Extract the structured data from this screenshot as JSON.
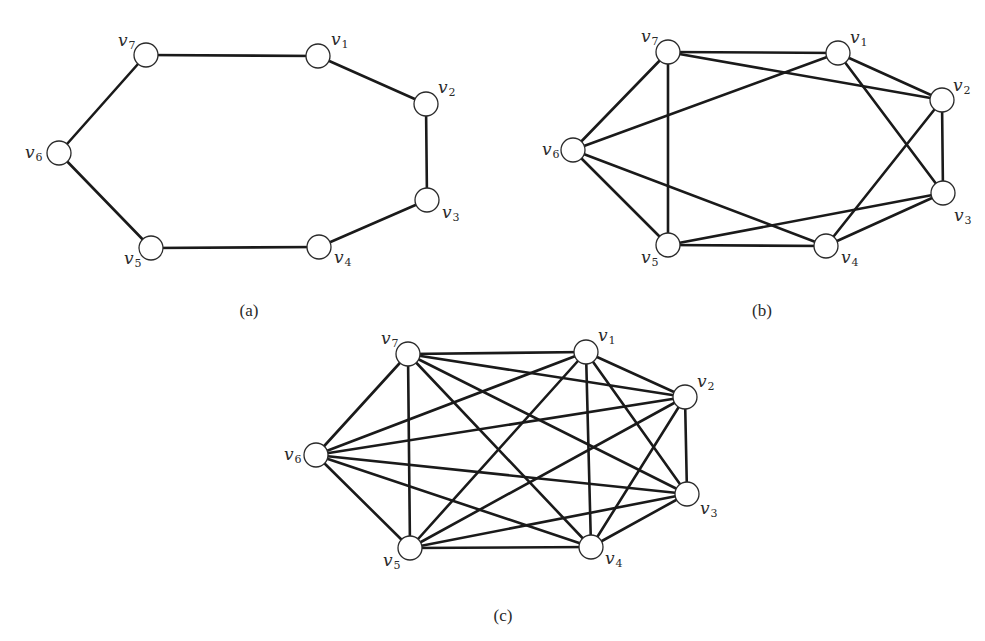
{
  "figure": {
    "panels": [
      {
        "id": "a",
        "caption": "(a)",
        "caption_pos": [
          249,
          316
        ],
        "description": "7-cycle C7",
        "vertices": [
          {
            "name": "v1",
            "base": "v",
            "sub": "1",
            "pos": [
              318,
              56
            ],
            "label_pos": [
              331,
              45
            ]
          },
          {
            "name": "v2",
            "base": "v",
            "sub": "2",
            "pos": [
              426,
              104
            ],
            "label_pos": [
              438,
              93
            ]
          },
          {
            "name": "v3",
            "base": "v",
            "sub": "3",
            "pos": [
              427,
              200
            ],
            "label_pos": [
              442,
              218
            ]
          },
          {
            "name": "v4",
            "base": "v",
            "sub": "4",
            "pos": [
              319,
              247
            ],
            "label_pos": [
              334,
              263
            ]
          },
          {
            "name": "v5",
            "base": "v",
            "sub": "5",
            "pos": [
              151,
              248
            ],
            "label_pos": [
              124,
              264
            ]
          },
          {
            "name": "v6",
            "base": "v",
            "sub": "6",
            "pos": [
              59,
              153
            ],
            "label_pos": [
              25,
              158
            ]
          },
          {
            "name": "v7",
            "base": "v",
            "sub": "7",
            "pos": [
              146,
              55
            ],
            "label_pos": [
              118,
              46
            ]
          }
        ],
        "edges": [
          [
            "v7",
            "v1"
          ],
          [
            "v1",
            "v2"
          ],
          [
            "v2",
            "v3"
          ],
          [
            "v3",
            "v4"
          ],
          [
            "v4",
            "v5"
          ],
          [
            "v5",
            "v6"
          ],
          [
            "v6",
            "v7"
          ]
        ]
      },
      {
        "id": "b",
        "caption": "(b)",
        "caption_pos": [
          762,
          316
        ],
        "description": "4-regular graph on 7 vertices (C7 plus distance-2 chords)",
        "vertices": [
          {
            "name": "v1",
            "base": "v",
            "sub": "1",
            "pos": [
              838,
              53
            ],
            "label_pos": [
              850,
              43
            ]
          },
          {
            "name": "v2",
            "base": "v",
            "sub": "2",
            "pos": [
              942,
              100
            ],
            "label_pos": [
              953,
              91
            ]
          },
          {
            "name": "v3",
            "base": "v",
            "sub": "3",
            "pos": [
              943,
              193
            ],
            "label_pos": [
              954,
              221
            ]
          },
          {
            "name": "v4",
            "base": "v",
            "sub": "4",
            "pos": [
              826,
              246
            ],
            "label_pos": [
              841,
              263
            ]
          },
          {
            "name": "v5",
            "base": "v",
            "sub": "5",
            "pos": [
              668,
              245
            ],
            "label_pos": [
              641,
              263
            ]
          },
          {
            "name": "v6",
            "base": "v",
            "sub": "6",
            "pos": [
              573,
              150
            ],
            "label_pos": [
              542,
              155
            ]
          },
          {
            "name": "v7",
            "base": "v",
            "sub": "7",
            "pos": [
              668,
              52
            ],
            "label_pos": [
              641,
              42
            ]
          }
        ],
        "edges": [
          [
            "v7",
            "v1"
          ],
          [
            "v1",
            "v2"
          ],
          [
            "v2",
            "v3"
          ],
          [
            "v3",
            "v4"
          ],
          [
            "v4",
            "v5"
          ],
          [
            "v5",
            "v6"
          ],
          [
            "v6",
            "v7"
          ],
          [
            "v7",
            "v2"
          ],
          [
            "v1",
            "v3"
          ],
          [
            "v2",
            "v4"
          ],
          [
            "v3",
            "v5"
          ],
          [
            "v4",
            "v6"
          ],
          [
            "v5",
            "v7"
          ],
          [
            "v6",
            "v1"
          ]
        ]
      },
      {
        "id": "c",
        "caption": "(c)",
        "caption_pos": [
          503,
          621
        ],
        "description": "Complete graph K7",
        "vertices": [
          {
            "name": "v1",
            "base": "v",
            "sub": "1",
            "pos": [
              586,
              352
            ],
            "label_pos": [
              598,
              341
            ]
          },
          {
            "name": "v2",
            "base": "v",
            "sub": "2",
            "pos": [
              685,
              397
            ],
            "label_pos": [
              697,
              387
            ]
          },
          {
            "name": "v3",
            "base": "v",
            "sub": "3",
            "pos": [
              687,
              494
            ],
            "label_pos": [
              700,
              514
            ]
          },
          {
            "name": "v4",
            "base": "v",
            "sub": "4",
            "pos": [
              591,
              547
            ],
            "label_pos": [
              605,
              564
            ]
          },
          {
            "name": "v5",
            "base": "v",
            "sub": "5",
            "pos": [
              410,
              548
            ],
            "label_pos": [
              383,
              566
            ]
          },
          {
            "name": "v6",
            "base": "v",
            "sub": "6",
            "pos": [
              316,
              455
            ],
            "label_pos": [
              284,
              460
            ]
          },
          {
            "name": "v7",
            "base": "v",
            "sub": "7",
            "pos": [
              408,
              354
            ],
            "label_pos": [
              381,
              344
            ]
          }
        ],
        "edges": [
          [
            "v1",
            "v2"
          ],
          [
            "v1",
            "v3"
          ],
          [
            "v1",
            "v4"
          ],
          [
            "v1",
            "v5"
          ],
          [
            "v1",
            "v6"
          ],
          [
            "v1",
            "v7"
          ],
          [
            "v2",
            "v3"
          ],
          [
            "v2",
            "v4"
          ],
          [
            "v2",
            "v5"
          ],
          [
            "v2",
            "v6"
          ],
          [
            "v2",
            "v7"
          ],
          [
            "v3",
            "v4"
          ],
          [
            "v3",
            "v5"
          ],
          [
            "v3",
            "v6"
          ],
          [
            "v3",
            "v7"
          ],
          [
            "v4",
            "v5"
          ],
          [
            "v4",
            "v6"
          ],
          [
            "v4",
            "v7"
          ],
          [
            "v5",
            "v6"
          ],
          [
            "v5",
            "v7"
          ],
          [
            "v6",
            "v7"
          ]
        ]
      }
    ],
    "node_radius": 12
  }
}
